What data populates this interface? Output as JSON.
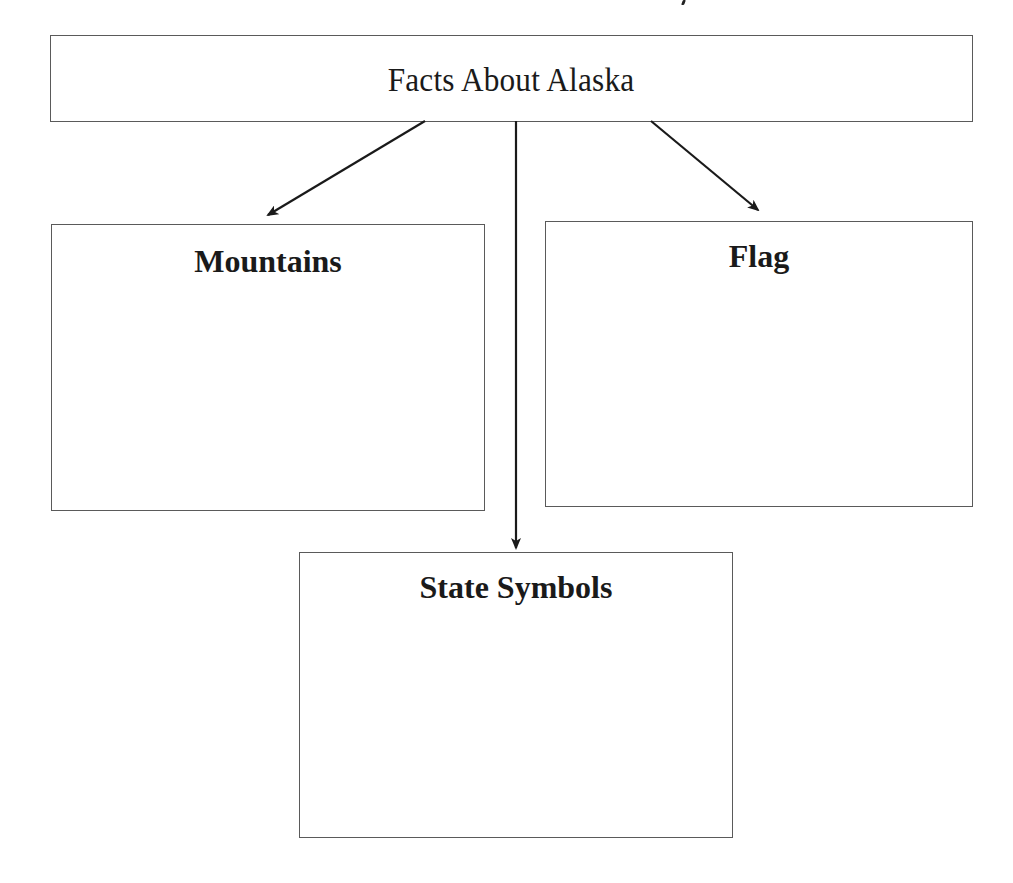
{
  "diagram": {
    "type": "graphic-organizer",
    "root": {
      "label": "Facts About Alaska"
    },
    "children": [
      {
        "label": "Mountains",
        "content": ""
      },
      {
        "label": "Flag",
        "content": ""
      },
      {
        "label": "State Symbols",
        "content": ""
      }
    ],
    "edges": [
      {
        "from": "Facts About Alaska",
        "to": "Mountains"
      },
      {
        "from": "Facts About Alaska",
        "to": "State Symbols"
      },
      {
        "from": "Facts About Alaska",
        "to": "Flag"
      }
    ],
    "colors": {
      "border": "#5a5a5a",
      "arrow": "#1a1a1a",
      "background": "#ffffff",
      "text": "#1a1a1a"
    }
  }
}
